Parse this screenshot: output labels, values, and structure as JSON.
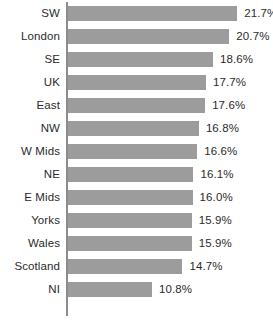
{
  "chart_data": {
    "type": "bar",
    "orientation": "horizontal",
    "title": "",
    "subtitle": "",
    "xlabel": "",
    "ylabel": "",
    "grid": false,
    "legend": null,
    "axis_visible": "y-axis-only",
    "xlim": [
      0,
      21.7
    ],
    "categories": [
      "SW",
      "London",
      "SE",
      "UK",
      "East",
      "NW",
      "W Mids",
      "NE",
      "E Mids",
      "Yorks",
      "Wales",
      "Scotland",
      "NI"
    ],
    "values": [
      21.7,
      20.7,
      18.6,
      17.7,
      17.6,
      16.8,
      16.6,
      16.1,
      16.0,
      15.9,
      15.9,
      14.7,
      10.8
    ],
    "data_labels": [
      "21.7%",
      "20.7%",
      "18.6%",
      "17.7%",
      "17.6%",
      "16.8%",
      "16.6%",
      "16.1%",
      "16.0%",
      "15.9%",
      "15.9%",
      "14.7%",
      "10.8%"
    ],
    "colors": {
      "bar_fill": "#9c9c9c",
      "axis": "#8c8c8c",
      "text": "#2b2b2b",
      "background": "#ffffff"
    }
  }
}
